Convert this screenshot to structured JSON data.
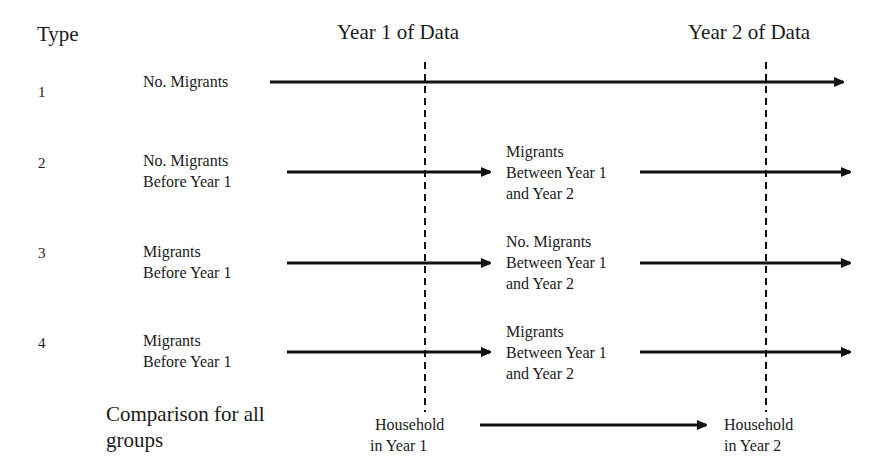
{
  "headers": {
    "type": "Type",
    "year1": "Year 1 of Data",
    "year2": "Year 2 of Data"
  },
  "rows": [
    {
      "type": "1",
      "stage1": [
        "No. Migrants"
      ],
      "stage2": []
    },
    {
      "type": "2",
      "stage1": [
        "No. Migrants",
        "Before Year 1"
      ],
      "stage2": [
        "Migrants",
        "Between Year 1",
        "and Year 2"
      ]
    },
    {
      "type": "3",
      "stage1": [
        "Migrants",
        "Before Year 1"
      ],
      "stage2": [
        "No. Migrants",
        "Between Year 1",
        "and Year 2"
      ]
    },
    {
      "type": "4",
      "stage1": [
        "Migrants",
        "Before Year 1"
      ],
      "stage2": [
        "Migrants",
        "Between Year 1",
        "and Year 2"
      ]
    }
  ],
  "comparison": {
    "label": [
      "Comparison for all",
      "groups"
    ],
    "from": [
      "Household",
      "in Year 1"
    ],
    "to": [
      "Household",
      "in Year 2"
    ]
  },
  "colors": {
    "line": "#111111",
    "text": "#1a1a1a",
    "background": "#ffffff"
  }
}
